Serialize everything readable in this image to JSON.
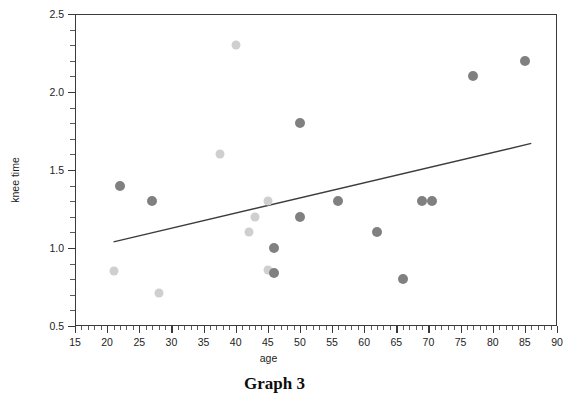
{
  "caption": "Graph 3",
  "chart_data": {
    "type": "scatter",
    "title": "Graph 3",
    "xlabel": "age",
    "ylabel": "knee time",
    "xlim": [
      15,
      90
    ],
    "ylim": [
      0.5,
      2.5
    ],
    "grid": false,
    "legend": "none",
    "x_major_ticks": [
      15,
      20,
      25,
      30,
      35,
      40,
      45,
      50,
      55,
      60,
      65,
      70,
      75,
      80,
      85,
      90
    ],
    "x_minor_step": 1,
    "y_major_ticks": [
      0.5,
      1.0,
      1.5,
      2.0,
      2.5
    ],
    "y_tick_labels": [
      "0.5",
      "1.0",
      "1.5",
      "2.0",
      "2.5"
    ],
    "y_minor_step": 0.1,
    "point_colors": {
      "dark": "#808080",
      "light": "#cfcfcf",
      "mid": "#bdbdbd"
    },
    "points": [
      {
        "x": 21,
        "y": 0.85,
        "shade": "light"
      },
      {
        "x": 22,
        "y": 1.4,
        "shade": "dark"
      },
      {
        "x": 27,
        "y": 1.3,
        "shade": "dark"
      },
      {
        "x": 28,
        "y": 0.71,
        "shade": "light"
      },
      {
        "x": 37.5,
        "y": 1.6,
        "shade": "light"
      },
      {
        "x": 40,
        "y": 2.3,
        "shade": "light"
      },
      {
        "x": 42,
        "y": 1.1,
        "shade": "light"
      },
      {
        "x": 43,
        "y": 1.2,
        "shade": "light"
      },
      {
        "x": 45,
        "y": 1.3,
        "shade": "light"
      },
      {
        "x": 45,
        "y": 0.86,
        "shade": "light"
      },
      {
        "x": 46,
        "y": 0.84,
        "shade": "dark"
      },
      {
        "x": 46,
        "y": 1.0,
        "shade": "dark"
      },
      {
        "x": 50,
        "y": 1.8,
        "shade": "dark"
      },
      {
        "x": 50,
        "y": 1.2,
        "shade": "dark"
      },
      {
        "x": 56,
        "y": 1.3,
        "shade": "dark"
      },
      {
        "x": 62,
        "y": 1.1,
        "shade": "dark"
      },
      {
        "x": 66,
        "y": 0.8,
        "shade": "dark"
      },
      {
        "x": 69,
        "y": 1.3,
        "shade": "dark"
      },
      {
        "x": 70.5,
        "y": 1.3,
        "shade": "dark"
      },
      {
        "x": 77,
        "y": 2.1,
        "shade": "dark"
      },
      {
        "x": 85,
        "y": 2.2,
        "shade": "dark"
      }
    ],
    "trendline": {
      "type": "linear-fit",
      "x_start": 21,
      "y_start": 1.04,
      "x_end": 86,
      "y_end": 1.67,
      "color": "#3c3c3c"
    }
  }
}
